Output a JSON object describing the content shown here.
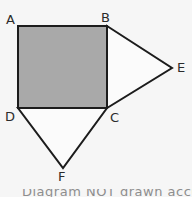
{
  "figure": {
    "canvas": {
      "width": 192,
      "height": 197
    },
    "background_color": "#f6f6f6",
    "stroke_color": "#1c1c1c",
    "stroke_width": 2,
    "shaded_fill_color": "#a9a9a9",
    "unshaded_fill_color": "#fbfbfb",
    "label_color": "#2b2b2b"
  },
  "vertices": {
    "A": {
      "label": "A",
      "x": 18,
      "y": 26,
      "label_x": 6,
      "label_y": 13
    },
    "B": {
      "label": "B",
      "x": 107,
      "y": 26,
      "label_x": 101,
      "label_y": 11
    },
    "C": {
      "label": "C",
      "x": 107,
      "y": 108,
      "label_x": 110,
      "label_y": 111
    },
    "D": {
      "label": "D",
      "x": 18,
      "y": 108,
      "label_x": 5,
      "label_y": 110
    },
    "E": {
      "label": "E",
      "x": 172,
      "y": 68,
      "label_x": 177,
      "label_y": 61
    },
    "F": {
      "label": "F",
      "x": 63,
      "y": 168,
      "label_x": 58,
      "label_y": 170
    }
  },
  "shapes": [
    {
      "name": "square-abcd",
      "kind": "polygon",
      "points": "A,B,C,D",
      "shaded": true,
      "fill": "#a9a9a9"
    },
    {
      "name": "triangle-bce",
      "kind": "polygon",
      "points": "B,E,C",
      "shaded": false,
      "fill": "#fbfbfb"
    },
    {
      "name": "triangle-dcf",
      "kind": "polygon",
      "points": "D,C,F",
      "shaded": false,
      "fill": "#fbfbfb"
    }
  ],
  "caption": {
    "text": "Diagram NOT drawn accurately",
    "clipped": true
  }
}
